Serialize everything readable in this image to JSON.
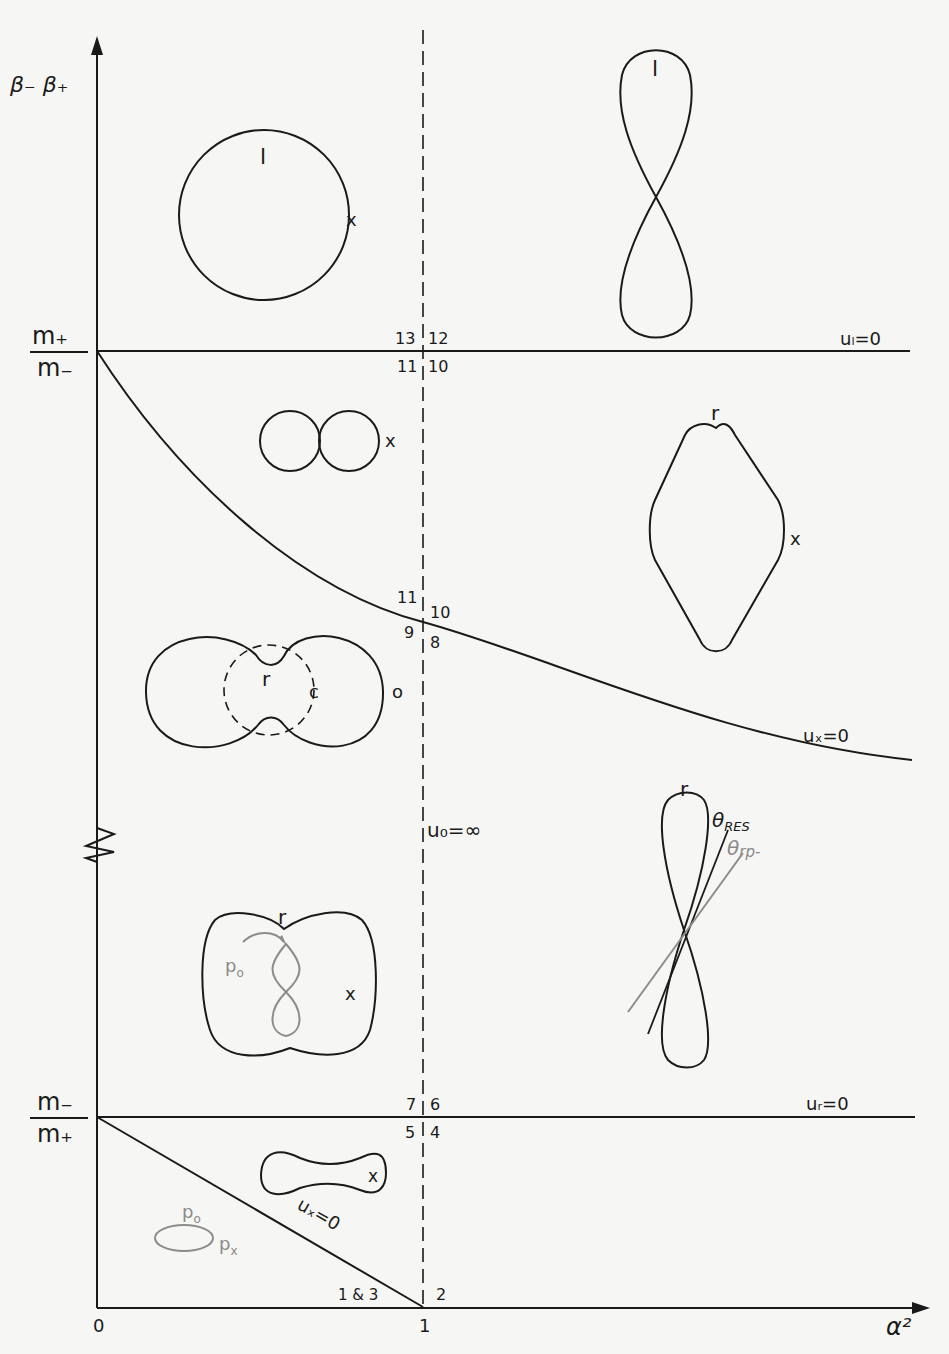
{
  "axes": {
    "y_label": "β₋ β₊",
    "x_label": "α²",
    "x_ticks": [
      "0",
      "1"
    ],
    "y_ticks": {
      "upper": {
        "num": "m₊",
        "den": "m₋"
      },
      "lower": {
        "num": "m₋",
        "den": "m₊"
      }
    }
  },
  "boundaries": {
    "u_l": "uₗ=0",
    "u_x_curve": "uₓ=0",
    "u_r": "uᵣ=0",
    "u_x_diag": "uₓ=0",
    "u_o": "u₀=∞"
  },
  "region_numbers": {
    "r13": "13",
    "r12": "12",
    "r11a": "11",
    "r10a": "10",
    "r11b": "11",
    "r10b": "10",
    "r9": "9",
    "r8": "8",
    "r7": "7",
    "r6": "6",
    "r5": "5",
    "r4": "4",
    "r1and3": "1 & 3",
    "r2": "2"
  },
  "shape_labels": {
    "circle_l": "l",
    "circle_x": "x",
    "fig8_l": "l",
    "dbl_x": "x",
    "diamond_r": "r",
    "diamond_x": "x",
    "overlap_r": "r",
    "overlap_c": "c",
    "overlap_o": "o",
    "loop_r": "r",
    "theta_res": "θ",
    "theta_res_sub": "RES",
    "theta_rp": "θ",
    "theta_rp_sub": "rp-",
    "apple_r": "r",
    "apple_po": "p",
    "apple_po_sub": "o",
    "apple_x": "x",
    "dogbone_x": "x",
    "ellipse_po": "p",
    "ellipse_po_sub": "o",
    "ellipse_px": "p",
    "ellipse_px_sub": "x"
  },
  "colors": {
    "ink": "#1a1a1a",
    "gray_ink": "#8a8a8a",
    "paper": "#f6f6f4"
  }
}
